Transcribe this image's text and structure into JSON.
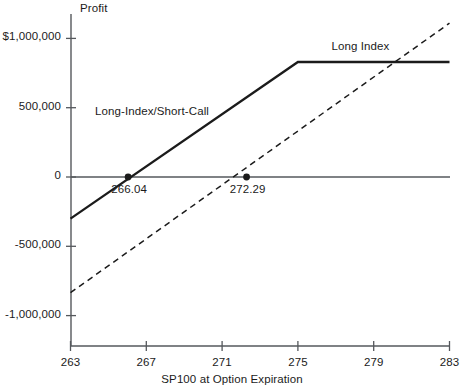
{
  "chart_data": {
    "type": "line",
    "title": "",
    "ylabel": "Profit",
    "xlabel": "SP100 at Option Expiration",
    "xlim": [
      263,
      283
    ],
    "ylim": [
      -1150000,
      1080000
    ],
    "grid": false,
    "legend_position": "inline-annotations",
    "x_ticks": [
      {
        "value": 263,
        "label": "263"
      },
      {
        "value": 267,
        "label": "267"
      },
      {
        "value": 271,
        "label": "271"
      },
      {
        "value": 275,
        "label": "275"
      },
      {
        "value": 279,
        "label": "279"
      },
      {
        "value": 283,
        "label": "283"
      }
    ],
    "y_ticks": [
      {
        "value": 1000000,
        "label": "$1,000,000"
      },
      {
        "value": 500000,
        "label": "500,000"
      },
      {
        "value": 0,
        "label": "0"
      },
      {
        "value": -500000,
        "label": "-500,000"
      },
      {
        "value": -1000000,
        "label": "-1,000,000"
      }
    ],
    "zero_line": {
      "value": 0,
      "style": "solid",
      "color": "#55585c"
    },
    "series": [
      {
        "name": "Long-Index/Short-Call",
        "style": "solid",
        "color": "#1b1b1b",
        "points": [
          {
            "x": 263,
            "y": -300000
          },
          {
            "x": 275,
            "y": 830000
          },
          {
            "x": 283,
            "y": 830000
          }
        ],
        "annotation": {
          "label": "Long-Index/Short-Call",
          "x": 267.3,
          "y": 460000
        }
      },
      {
        "name": "Long Index",
        "style": "dashed",
        "color": "#1b1b1b",
        "points": [
          {
            "x": 263,
            "y": -835000
          },
          {
            "x": 283,
            "y": 1110000
          }
        ],
        "annotation": {
          "label": "Long Index",
          "x": 278.3,
          "y": 930000
        }
      }
    ],
    "markers": [
      {
        "label": "266.04",
        "x": 266.04,
        "y": 0
      },
      {
        "label": "272.29",
        "x": 272.29,
        "y": 0
      }
    ]
  },
  "colors": {
    "axis": "#55585c",
    "line": "#1b1b1b",
    "text": "#1b1b1b",
    "background": "#ffffff"
  }
}
